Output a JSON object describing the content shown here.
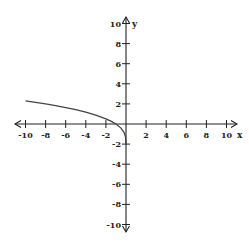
{
  "chart_data": {
    "type": "line",
    "title": "",
    "xlabel": "x",
    "ylabel": "y",
    "xlim": [
      -10,
      10
    ],
    "ylim": [
      -10,
      10
    ],
    "grid": false,
    "x_ticks": [
      -10,
      -8,
      -6,
      -4,
      -2,
      2,
      4,
      6,
      8,
      10
    ],
    "y_ticks": [
      10,
      8,
      6,
      4,
      2,
      -2,
      -4,
      -6,
      -8,
      -10
    ],
    "x_tick_labels": [
      "-10",
      "-8",
      "-6",
      "-4",
      "-2",
      "2",
      "4",
      "6",
      "8",
      "10"
    ],
    "y_tick_labels": [
      "10",
      "8",
      "6",
      "4",
      "2",
      "-2",
      "-4",
      "-6",
      "-8",
      "-10"
    ],
    "series": [
      {
        "name": "f(x)",
        "x": [
          -10,
          -9,
          -8,
          -7,
          -6,
          -5,
          -4,
          -3,
          -2,
          -1.5,
          -1,
          -0.5,
          -0.2,
          -0.05,
          0
        ],
        "values": [
          2.31,
          2.16,
          2.0,
          1.83,
          1.63,
          1.42,
          1.17,
          0.88,
          0.52,
          0.29,
          0.0,
          -0.41,
          -0.83,
          -1.26,
          -2.0
        ]
      }
    ]
  },
  "axes": {
    "x_label": "x",
    "y_label": "y",
    "color": "#222222"
  },
  "curve": {
    "color": "#444444"
  }
}
